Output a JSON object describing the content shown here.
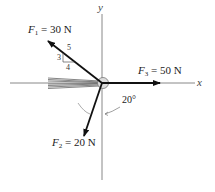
{
  "diagram": {
    "type": "force-diagram",
    "axes": {
      "x_label": "x",
      "y_label": "y"
    },
    "forces": [
      {
        "id": "F1",
        "symbol": "F",
        "subscript": "1",
        "equals": " = ",
        "value": "30 N",
        "slope": {
          "rise": "3",
          "run": "4",
          "hyp": "5"
        }
      },
      {
        "id": "F2",
        "symbol": "F",
        "subscript": "2",
        "equals": " = ",
        "value": "20 N",
        "angle": "20°"
      },
      {
        "id": "F3",
        "symbol": "F",
        "subscript": "3",
        "equals": " = ",
        "value": "50 N"
      }
    ],
    "colors": {
      "line": "#111111",
      "axis": "#888888",
      "support": "#777777"
    }
  }
}
